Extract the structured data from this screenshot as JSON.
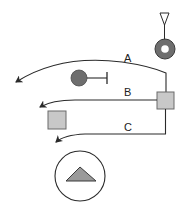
{
  "diagram": {
    "colors": {
      "stroke": "#2a2a2a",
      "dark_fill": "#707070",
      "square_fill": "#c8c8c8",
      "triangle_fill": "#9a9a9a",
      "background": "#ffffff"
    },
    "labels": {
      "a": "A",
      "b": "B",
      "c": "C"
    },
    "nodes": [
      {
        "id": "receptor",
        "shape": "triangle-on-stem-with-ring",
        "icon": "receptor-icon"
      },
      {
        "id": "inhibitor",
        "shape": "filled-circle-with-t-bar",
        "icon": "inhibitor-icon"
      },
      {
        "id": "hub",
        "shape": "square",
        "icon": "hub-square-icon"
      },
      {
        "id": "target-square",
        "shape": "square",
        "icon": "target-square-icon"
      },
      {
        "id": "output",
        "shape": "circle-with-triangle",
        "icon": "output-triangle-icon"
      }
    ],
    "edges": [
      {
        "label": "A",
        "from": "hub",
        "to": "left"
      },
      {
        "label": "B",
        "from": "hub",
        "to": "left"
      },
      {
        "label": "C",
        "from": "hub",
        "to": "left"
      }
    ]
  }
}
